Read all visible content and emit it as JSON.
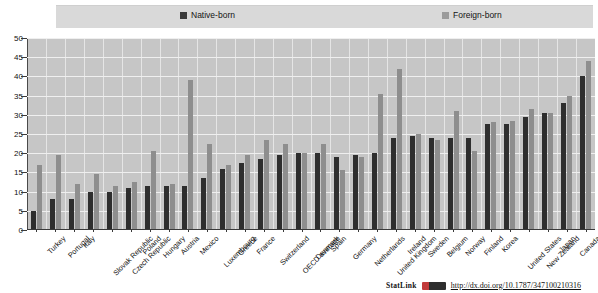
{
  "legend": {
    "native_label": "Native-born",
    "foreign_label": "Foreign-born",
    "native_color": "#2e2e2e",
    "foreign_color": "#8e8e8e"
  },
  "footer": {
    "statlink_label": "StatLink",
    "url": "http://dx.doi.org/10.1787/347100210316"
  },
  "chart_data": {
    "type": "bar",
    "title": "",
    "xlabel": "",
    "ylabel": "",
    "ylim": [
      0,
      50
    ],
    "yticks": [
      0,
      5,
      10,
      15,
      20,
      25,
      30,
      35,
      40,
      45,
      50
    ],
    "grid": true,
    "legend_position": "top",
    "categories": [
      "Turkey",
      "Portugal",
      "Italy",
      "Slovak Republic",
      "Czech Republic",
      "Poland",
      "Hungary",
      "Austria",
      "Mexico",
      "Luxembourg",
      "Greece",
      "France",
      "Switzerland",
      "OECD average",
      "Denmark",
      "Spain",
      "Germany",
      "Netherlands",
      "United Kingdom",
      "Ireland",
      "Sweden",
      "Belgium",
      "Norway",
      "Finland",
      "Korea",
      "United States",
      "New Zealand",
      "Japan",
      "Canada",
      "Australia"
    ],
    "series": [
      {
        "name": "Native-born",
        "color": "#2e2e2e",
        "values": [
          5,
          8,
          8,
          10,
          10,
          11,
          11.5,
          11.5,
          11.5,
          13.5,
          16,
          17.5,
          18.5,
          19.5,
          20,
          20,
          19,
          19.5,
          20,
          24,
          24.5,
          24,
          24,
          24,
          27.5,
          27.5,
          29.5,
          30.5,
          33,
          40
        ]
      },
      {
        "name": "Foreign-born",
        "color": "#8e8e8e",
        "values": [
          17,
          19.5,
          12,
          14.5,
          11.5,
          12.5,
          20.5,
          12,
          39,
          22.5,
          17,
          19.5,
          23.5,
          22.5,
          20,
          22.5,
          15.5,
          19,
          35.5,
          42,
          25,
          23.5,
          31,
          20.5,
          28,
          28.5,
          31.5,
          30.5,
          35,
          44
        ]
      }
    ]
  }
}
